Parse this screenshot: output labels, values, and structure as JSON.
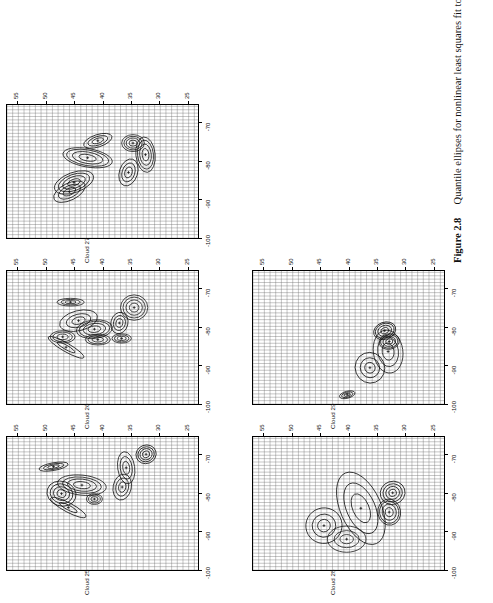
{
  "figure": {
    "number_label": "Figure 2.8",
    "caption_text": "Quantile ellipses for nonlinear least squares fit to Cloud26–Cloud29."
  },
  "chart_data": {
    "type": "scatter",
    "title": "Quantile ellipses for nonlinear least squares fit to Cloud26–Cloud29.",
    "xlabel": "",
    "ylabel": "",
    "xlim": [
      -100,
      -65
    ],
    "ylim": [
      23,
      57
    ],
    "xticks": [
      -100,
      -90,
      -80,
      -70
    ],
    "xtick_labels": [
      "-100",
      "-90",
      "-80",
      "-70"
    ],
    "yticks": [
      25,
      30,
      35,
      40,
      45,
      50,
      55
    ],
    "ytick_labels": [
      "25",
      "30",
      "35",
      "40",
      "45",
      "50",
      "55"
    ],
    "grid": true,
    "grid_minor": true,
    "legend": "none",
    "panel_layout": {
      "rows": 2,
      "cols": 3,
      "note": "Cloud 25, Cloud 26, Cloud 27 on top row; Cloud 28, Cloud 29 on bottom row"
    },
    "panels": [
      {
        "name": "Cloud 25",
        "label": "Cloud 25",
        "ellipse_groups": [
          {
            "cx": -70.0,
            "cy": 32.5,
            "rx": 2.4,
            "ry": 1.8,
            "angle": -20,
            "levels": [
              0.35,
              0.6,
              0.8,
              1.0
            ]
          },
          {
            "cx": -73.5,
            "cy": 36.0,
            "rx": 4.2,
            "ry": 1.5,
            "angle": -8,
            "levels": [
              0.4,
              0.7,
              1.0
            ]
          },
          {
            "cx": -78.5,
            "cy": 36.7,
            "rx": 3.4,
            "ry": 1.6,
            "angle": 12,
            "levels": [
              0.4,
              0.7,
              1.0
            ]
          },
          {
            "cx": -78.0,
            "cy": 43.8,
            "rx": 2.6,
            "ry": 4.3,
            "angle": 6,
            "levels": [
              0.35,
              0.6,
              0.8,
              1.0
            ]
          },
          {
            "cx": -73.2,
            "cy": 48.8,
            "rx": 1.0,
            "ry": 2.6,
            "angle": -10,
            "levels": [
              0.4,
              0.7,
              1.0
            ]
          },
          {
            "cx": -81.6,
            "cy": 41.6,
            "rx": 1.4,
            "ry": 1.4,
            "angle": 0,
            "levels": [
              0.45,
              0.75,
              1.0
            ]
          },
          {
            "cx": -80.2,
            "cy": 47.4,
            "rx": 3.2,
            "ry": 2.6,
            "angle": 18,
            "levels": [
              0.3,
              0.55,
              0.78,
              1.0
            ]
          },
          {
            "cx": -83.8,
            "cy": 46.2,
            "rx": 1.2,
            "ry": 3.5,
            "angle": 28,
            "levels": [
              0.5,
              1.0
            ]
          }
        ]
      },
      {
        "name": "Cloud 26",
        "label": "Cloud 26",
        "ellipse_groups": [
          {
            "cx": -75.0,
            "cy": 34.6,
            "rx": 3.3,
            "ry": 2.4,
            "angle": 0,
            "levels": [
              0.35,
              0.6,
              0.82,
              1.0
            ]
          },
          {
            "cx": -79.0,
            "cy": 37.2,
            "rx": 2.8,
            "ry": 1.5,
            "angle": 14,
            "levels": [
              0.4,
              0.7,
              1.0
            ]
          },
          {
            "cx": -83.0,
            "cy": 36.8,
            "rx": 1.2,
            "ry": 1.7,
            "angle": 0,
            "levels": [
              0.45,
              0.75,
              1.0
            ]
          },
          {
            "cx": -80.6,
            "cy": 41.6,
            "rx": 2.4,
            "ry": 3.2,
            "angle": -6,
            "levels": [
              0.35,
              0.62,
              0.85,
              1.0
            ]
          },
          {
            "cx": -83.3,
            "cy": 41.0,
            "rx": 1.4,
            "ry": 2.2,
            "angle": 0,
            "levels": [
              0.45,
              0.78,
              1.0
            ]
          },
          {
            "cx": -78.4,
            "cy": 44.4,
            "rx": 2.6,
            "ry": 3.4,
            "angle": -14,
            "levels": [
              0.35,
              0.65,
              1.0
            ]
          },
          {
            "cx": -73.6,
            "cy": 45.8,
            "rx": 1.0,
            "ry": 2.4,
            "angle": 0,
            "levels": [
              0.4,
              0.7,
              1.0
            ]
          },
          {
            "cx": -82.6,
            "cy": 47.2,
            "rx": 1.6,
            "ry": 2.2,
            "angle": 0,
            "levels": [
              0.45,
              0.78,
              1.0
            ]
          },
          {
            "cx": -85.3,
            "cy": 46.6,
            "rx": 1.1,
            "ry": 3.6,
            "angle": 30,
            "levels": [
              0.5,
              1.0
            ]
          }
        ]
      },
      {
        "name": "Cloud 27",
        "label": "Cloud 27",
        "ellipse_groups": [
          {
            "cx": -78.4,
            "cy": 32.6,
            "rx": 4.6,
            "ry": 1.7,
            "angle": -6,
            "levels": [
              0.35,
              0.6,
              0.82,
              1.0
            ]
          },
          {
            "cx": -75.4,
            "cy": 34.8,
            "rx": 2.2,
            "ry": 2.0,
            "angle": 0,
            "levels": [
              0.35,
              0.6,
              0.8,
              1.0
            ]
          },
          {
            "cx": -83.0,
            "cy": 35.6,
            "rx": 3.6,
            "ry": 1.6,
            "angle": 18,
            "levels": [
              0.4,
              0.7,
              1.0
            ]
          },
          {
            "cx": -74.8,
            "cy": 41.0,
            "rx": 1.6,
            "ry": 2.6,
            "angle": -18,
            "levels": [
              0.4,
              0.7,
              1.0
            ]
          },
          {
            "cx": -79.2,
            "cy": 42.8,
            "rx": 2.4,
            "ry": 4.4,
            "angle": 10,
            "levels": [
              0.35,
              0.62,
              0.85,
              1.0
            ]
          },
          {
            "cx": -85.6,
            "cy": 45.2,
            "rx": 2.6,
            "ry": 3.6,
            "angle": -20,
            "levels": [
              0.32,
              0.58,
              0.8,
              1.0
            ]
          },
          {
            "cx": -88.0,
            "cy": 46.0,
            "rx": 2.2,
            "ry": 3.0,
            "angle": -26,
            "levels": [
              0.4,
              0.7,
              1.0
            ]
          }
        ]
      },
      {
        "name": "Cloud 28",
        "label": "Cloud 28",
        "ellipse_groups": [
          {
            "cx": -80.0,
            "cy": 32.4,
            "rx": 3.0,
            "ry": 2.2,
            "angle": -18,
            "levels": [
              0.3,
              0.55,
              0.78,
              1.0
            ]
          },
          {
            "cx": -85.0,
            "cy": 33.0,
            "rx": 3.4,
            "ry": 2.0,
            "angle": -10,
            "levels": [
              0.35,
              0.62,
              0.85,
              1.0
            ]
          },
          {
            "cx": -84.0,
            "cy": 38.0,
            "rx": 10.0,
            "ry": 3.6,
            "angle": -24,
            "levels": [
              0.4,
              0.7,
              1.0
            ]
          },
          {
            "cx": -92.0,
            "cy": 40.5,
            "rx": 3.4,
            "ry": 3.4,
            "angle": 0,
            "levels": [
              0.35,
              0.65,
              1.0
            ]
          },
          {
            "cx": -88.5,
            "cy": 44.5,
            "rx": 4.6,
            "ry": 3.2,
            "angle": -18,
            "levels": [
              0.35,
              0.65,
              1.0
            ]
          }
        ]
      },
      {
        "name": "Cloud 29",
        "label": "Cloud 29",
        "ellipse_groups": [
          {
            "cx": -81.0,
            "cy": 33.8,
            "rx": 2.2,
            "ry": 2.0,
            "angle": -20,
            "levels": [
              0.35,
              0.62,
              0.85,
              1.0
            ]
          },
          {
            "cx": -83.8,
            "cy": 33.0,
            "rx": 2.0,
            "ry": 1.8,
            "angle": -10,
            "levels": [
              0.35,
              0.62,
              0.85,
              1.0
            ]
          },
          {
            "cx": -86.4,
            "cy": 33.2,
            "rx": 5.6,
            "ry": 2.6,
            "angle": -8,
            "levels": [
              0.4,
              0.7,
              1.0
            ]
          },
          {
            "cx": -90.6,
            "cy": 36.4,
            "rx": 4.0,
            "ry": 2.6,
            "angle": -22,
            "levels": [
              0.35,
              0.65,
              1.0
            ]
          },
          {
            "cx": -97.6,
            "cy": 40.4,
            "rx": 0.9,
            "ry": 1.4,
            "angle": -15,
            "levels": [
              0.4,
              0.72,
              1.0
            ]
          }
        ]
      }
    ]
  }
}
